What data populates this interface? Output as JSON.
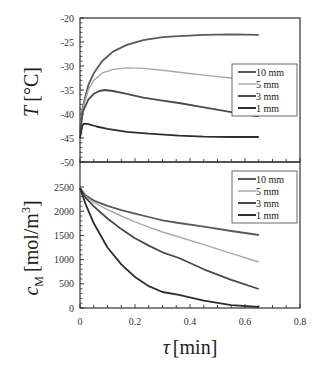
{
  "chart_data": [
    {
      "type": "line",
      "panel": "top",
      "title": "",
      "xlabel": "τ [min]",
      "ylabel": "T [°C]",
      "ylabel_italic": "T",
      "ylabel_unit": "[°C]",
      "xlim": [
        0,
        0.8
      ],
      "ylim": [
        -50,
        -20
      ],
      "yticks": [
        -50,
        -45,
        -40,
        -35,
        -30,
        -25,
        -20
      ],
      "xticks": [
        0,
        0.2,
        0.4,
        0.6,
        0.8
      ],
      "grid": false,
      "legend_position": "right-middle",
      "series": [
        {
          "name": "10 mm",
          "color": "#5a5a5a",
          "x": [
            0,
            0.01,
            0.03,
            0.05,
            0.08,
            0.12,
            0.17,
            0.23,
            0.3,
            0.36,
            0.45,
            0.55,
            0.65
          ],
          "y": [
            -44,
            -38.5,
            -34,
            -31.5,
            -29,
            -27,
            -25.6,
            -24.6,
            -24.0,
            -23.8,
            -23.5,
            -23.4,
            -23.5
          ]
        },
        {
          "name": "5 mm",
          "color": "#a8a8a8",
          "x": [
            0,
            0.01,
            0.03,
            0.05,
            0.08,
            0.12,
            0.17,
            0.23,
            0.3,
            0.36,
            0.45,
            0.55,
            0.65
          ],
          "y": [
            -44,
            -38.8,
            -35,
            -33,
            -31.5,
            -30.7,
            -30.4,
            -30.5,
            -30.9,
            -31.3,
            -31.9,
            -32.5,
            -33.0
          ]
        },
        {
          "name": "3 mm",
          "color": "#4a4a4a",
          "x": [
            0,
            0.01,
            0.03,
            0.05,
            0.07,
            0.09,
            0.12,
            0.17,
            0.23,
            0.3,
            0.36,
            0.45,
            0.55,
            0.65
          ],
          "y": [
            -44,
            -39.5,
            -37,
            -35.8,
            -35.2,
            -35.0,
            -35.2,
            -35.8,
            -36.6,
            -37.2,
            -37.7,
            -38.6,
            -39.6,
            -40.5
          ]
        },
        {
          "name": "1 mm",
          "color": "#2e2e2e",
          "x": [
            0,
            0.008,
            0.015,
            0.03,
            0.06,
            0.1,
            0.17,
            0.25,
            0.36,
            0.45,
            0.55,
            0.65
          ],
          "y": [
            -45,
            -42.5,
            -42.0,
            -42.1,
            -42.6,
            -43.1,
            -43.7,
            -44.1,
            -44.5,
            -44.7,
            -44.8,
            -44.8
          ]
        }
      ]
    },
    {
      "type": "line",
      "panel": "bottom",
      "title": "",
      "xlabel": "τ [min]",
      "ylabel": "c_M [mol/m³]",
      "ylabel_italic": "c",
      "ylabel_sub": "M",
      "ylabel_unit": "[mol/m",
      "ylabel_sup": "3",
      "ylabel_close": "]",
      "xlim": [
        0,
        0.8
      ],
      "ylim": [
        0,
        2700
      ],
      "yticks": [
        0,
        500,
        1000,
        1500,
        2000,
        2500
      ],
      "xticks": [
        0,
        0.2,
        0.4,
        0.6,
        0.8
      ],
      "grid": false,
      "legend_position": "upper-right",
      "series": [
        {
          "name": "10 mm",
          "color": "#5a5a5a",
          "x": [
            0,
            0.02,
            0.05,
            0.1,
            0.15,
            0.2,
            0.25,
            0.3,
            0.36,
            0.45,
            0.55,
            0.65
          ],
          "y": [
            2480,
            2330,
            2220,
            2110,
            2020,
            1950,
            1880,
            1810,
            1756,
            1680,
            1590,
            1508
          ]
        },
        {
          "name": "5 mm",
          "color": "#a8a8a8",
          "x": [
            0,
            0.02,
            0.05,
            0.1,
            0.15,
            0.2,
            0.25,
            0.3,
            0.36,
            0.45,
            0.55,
            0.65
          ],
          "y": [
            2480,
            2310,
            2180,
            2030,
            1900,
            1780,
            1670,
            1570,
            1467,
            1310,
            1130,
            950
          ]
        },
        {
          "name": "3 mm",
          "color": "#4a4a4a",
          "x": [
            0,
            0.02,
            0.05,
            0.1,
            0.15,
            0.2,
            0.25,
            0.3,
            0.36,
            0.45,
            0.55,
            0.65
          ],
          "y": [
            2480,
            2280,
            2100,
            1850,
            1630,
            1440,
            1290,
            1150,
            1033,
            800,
            580,
            393
          ]
        },
        {
          "name": "1 mm",
          "color": "#2e2e2e",
          "x": [
            0,
            0.02,
            0.05,
            0.1,
            0.15,
            0.2,
            0.25,
            0.3,
            0.36,
            0.45,
            0.55,
            0.65
          ],
          "y": [
            2480,
            2150,
            1750,
            1250,
            900,
            640,
            450,
            330,
            270,
            150,
            60,
            20
          ]
        }
      ]
    }
  ],
  "labels": {
    "top_ylabel_italic": "T",
    "top_ylabel_unit": "[°C]",
    "bottom_ylabel_italic": "c",
    "bottom_ylabel_sub": "M",
    "bottom_ylabel_unit": "[mol/m",
    "bottom_ylabel_sup": "3",
    "bottom_ylabel_close": "]",
    "xlabel_italic": "τ",
    "xlabel_unit": "[min]"
  }
}
